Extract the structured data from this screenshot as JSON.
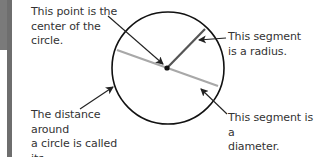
{
  "diagram": {
    "labels": {
      "center": "This point is the\ncenter of the\ncircle.",
      "circumference": "The distance around\na circle is called its\ncircumference.",
      "radius": "This segment\nis a radius.",
      "diameter": "This segment is a\ndiameter."
    },
    "elements": {
      "circle": "circle-outline",
      "center_point": "center-dot",
      "radius": "radius-segment",
      "diameter": "diameter-segment"
    },
    "colors": {
      "outline": "#111111",
      "radius_line": "#555555",
      "diameter_line": "#a8a8a8",
      "arrow": "#222222",
      "text": "#333333",
      "left_bar": "#7a7a7a"
    }
  }
}
